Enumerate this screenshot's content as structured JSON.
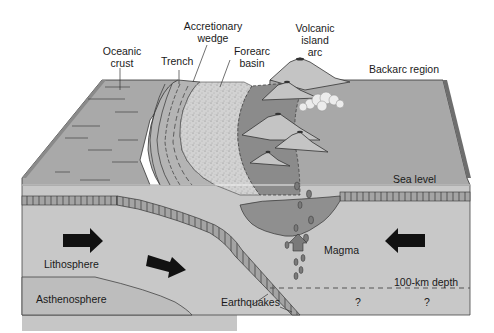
{
  "figure": {
    "type": "block diagram"
  },
  "labels": {
    "oceanic_crust": [
      "Oceanic",
      "crust"
    ],
    "trench": "Trench",
    "accretionary_wedge": [
      "Accretionary",
      "wedge"
    ],
    "forearc_basin": [
      "Forearc",
      "basin"
    ],
    "volcanic_island_arc": [
      "Volcanic",
      "island",
      "arc"
    ],
    "backarc_region": "Backarc region",
    "sea_level": "Sea level",
    "lithosphere": "Lithosphere",
    "asthenosphere": "Asthenosphere",
    "magma": "Magma",
    "depth_line": "100-km depth",
    "earthquakes": "Earthquakes",
    "unknown_1": "?",
    "unknown_2": "?"
  },
  "arrows": [
    {
      "id": "plate-motion-left",
      "direction": "right"
    },
    {
      "id": "subduction-motion",
      "direction": "down-right"
    },
    {
      "id": "plate-motion-right",
      "direction": "left"
    },
    {
      "id": "magma-rise",
      "direction": "up"
    }
  ],
  "colors": {
    "ocean_surface": "#a9a9a9",
    "forearc_sediment": "#cfcfcf",
    "arc_region": "#8c8c8c",
    "volcano": "#c4c4c4",
    "mantle": "#c8c8c8",
    "slab": "#9a9a9a",
    "outline": "#333333",
    "arrow": "#111111",
    "magma": "#7a7a7a"
  }
}
